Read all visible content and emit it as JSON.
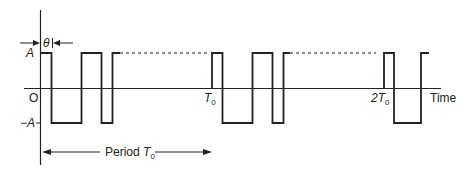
{
  "figure": {
    "type": "periodic-waveform",
    "levels": {
      "high": "A",
      "zero": "O",
      "low": "−A"
    },
    "axis": {
      "x_label": "Time"
    },
    "ticks": [
      {
        "label": "T",
        "subscript": "0"
      },
      {
        "label": "2T",
        "subscript": "0"
      }
    ],
    "delay_marker": {
      "label": "θ"
    },
    "period_annotation": {
      "text": "Period ",
      "symbol": "T",
      "subscript": "0"
    },
    "colors": {
      "stroke": "#222222",
      "background": "#ffffff"
    },
    "waveform_periods": 3
  }
}
